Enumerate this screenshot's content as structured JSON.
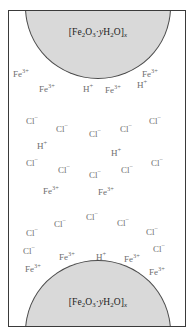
{
  "figure": {
    "frame_border_color": "#3a3a3a",
    "background_color": "#ffffff"
  },
  "particles": [
    {
      "name": "top-particle",
      "formula_text": "[Fe2O3·yH2O]x",
      "formula_display": "[Fe₂O₃·yH₂O]ₓ",
      "fill_color": "#d9d9d9",
      "outline_color": "#4a4a4a",
      "position": "top"
    },
    {
      "name": "bottom-particle",
      "formula_text": "[Fe2O3·yH2O]x",
      "formula_display": "[Fe₂O₃·yH₂O]ₓ",
      "fill_color": "#d9d9d9",
      "outline_color": "#4a4a4a",
      "position": "bottom"
    }
  ],
  "ion_color": "#6e6e6e",
  "ions": [
    {
      "species": "Fe",
      "charge": "3+",
      "x": 12,
      "y": 69
    },
    {
      "species": "Fe",
      "charge": "3+",
      "x": 141,
      "y": 69
    },
    {
      "species": "Fe",
      "charge": "3+",
      "x": 38,
      "y": 84
    },
    {
      "species": "H",
      "charge": "+",
      "x": 82,
      "y": 84
    },
    {
      "species": "Fe",
      "charge": "3+",
      "x": 104,
      "y": 85
    },
    {
      "species": "H",
      "charge": "+",
      "x": 136,
      "y": 80
    },
    {
      "species": "Cl",
      "charge": "−",
      "x": 25,
      "y": 116
    },
    {
      "species": "Cl",
      "charge": "−",
      "x": 55,
      "y": 124
    },
    {
      "species": "Cl",
      "charge": "−",
      "x": 88,
      "y": 129
    },
    {
      "species": "Cl",
      "charge": "−",
      "x": 119,
      "y": 124
    },
    {
      "species": "Cl",
      "charge": "−",
      "x": 148,
      "y": 116
    },
    {
      "species": "H",
      "charge": "+",
      "x": 36,
      "y": 141
    },
    {
      "species": "H",
      "charge": "+",
      "x": 110,
      "y": 148
    },
    {
      "species": "Cl",
      "charge": "−",
      "x": 25,
      "y": 158
    },
    {
      "species": "Cl",
      "charge": "−",
      "x": 57,
      "y": 165
    },
    {
      "species": "Cl",
      "charge": "−",
      "x": 88,
      "y": 170
    },
    {
      "species": "Cl",
      "charge": "−",
      "x": 120,
      "y": 165
    },
    {
      "species": "Cl",
      "charge": "−",
      "x": 150,
      "y": 158
    },
    {
      "species": "Fe",
      "charge": "3+",
      "x": 42,
      "y": 186
    },
    {
      "species": "Fe",
      "charge": "3+",
      "x": 97,
      "y": 187
    },
    {
      "species": "Cl",
      "charge": "−",
      "x": 85,
      "y": 212
    },
    {
      "species": "Cl",
      "charge": "−",
      "x": 53,
      "y": 219
    },
    {
      "species": "Cl",
      "charge": "−",
      "x": 116,
      "y": 218
    },
    {
      "species": "Cl",
      "charge": "−",
      "x": 25,
      "y": 228
    },
    {
      "species": "Cl",
      "charge": "−",
      "x": 145,
      "y": 227
    },
    {
      "species": "Cl",
      "charge": "−",
      "x": 22,
      "y": 246
    },
    {
      "species": "Cl",
      "charge": "−",
      "x": 152,
      "y": 244
    },
    {
      "species": "Fe",
      "charge": "3+",
      "x": 58,
      "y": 252
    },
    {
      "species": "H",
      "charge": "+",
      "x": 95,
      "y": 252
    },
    {
      "species": "Fe",
      "charge": "3+",
      "x": 123,
      "y": 254
    },
    {
      "species": "Fe",
      "charge": "3+",
      "x": 24,
      "y": 264
    },
    {
      "species": "Fe",
      "charge": "3+",
      "x": 148,
      "y": 267
    }
  ]
}
